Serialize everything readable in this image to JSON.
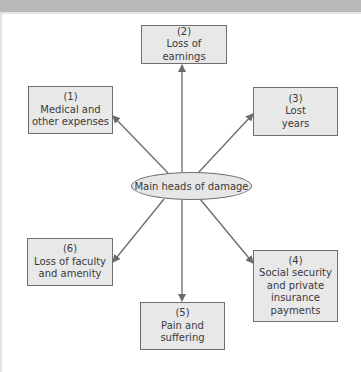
{
  "diagram": {
    "center": {
      "label": "Main heads of damage"
    },
    "nodes": [
      {
        "number": "(1)",
        "lines": [
          "Medical and",
          "other expenses"
        ]
      },
      {
        "number": "(2)",
        "lines": [
          "Loss of",
          "earnings"
        ]
      },
      {
        "number": "(3)",
        "lines": [
          "Lost",
          "years"
        ]
      },
      {
        "number": "(4)",
        "lines": [
          "Social security",
          "and private",
          "insurance",
          "payments"
        ]
      },
      {
        "number": "(5)",
        "lines": [
          "Pain and",
          "suffering"
        ]
      },
      {
        "number": "(6)",
        "lines": [
          "Loss of faculty",
          "and amenity"
        ]
      }
    ],
    "colors": {
      "box_fill": "#e8e8e8",
      "box_border": "#6f6f6f",
      "arrow": "#6a6a6a",
      "text": "#3a3a3a",
      "top_bar": "#b9b9b9"
    }
  }
}
